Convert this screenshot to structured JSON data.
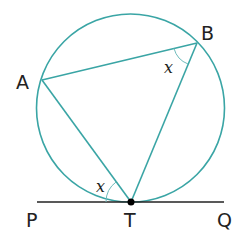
{
  "diagram": {
    "points": {
      "A": "A",
      "B": "B",
      "T": "T",
      "P": "P",
      "Q": "Q"
    },
    "angles": {
      "angle_ABT": "x",
      "angle_ATP": "x"
    },
    "colors": {
      "circle": "#3aa5a5",
      "tangent": "#222222",
      "point": "#000000"
    }
  }
}
